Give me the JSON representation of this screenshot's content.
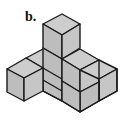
{
  "figure": {
    "label": "b.",
    "fill_color": "#c4c4c4",
    "stroke_color": "#1a1a1a"
  }
}
